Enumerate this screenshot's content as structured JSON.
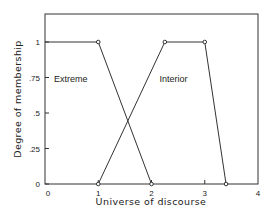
{
  "chart_data": {
    "type": "line",
    "title": "",
    "xlabel": "Universe of discourse",
    "ylabel": "Degree of membership",
    "xlim": [
      0,
      4
    ],
    "ylim": [
      0,
      1
    ],
    "grid": false,
    "legend": "inline labels",
    "x_ticks": [
      "0",
      "1",
      "2",
      "3",
      "4"
    ],
    "x_tick_values": [
      0,
      1,
      2,
      3,
      4
    ],
    "y_ticks": [
      "0",
      ".25",
      ".5",
      ".75",
      "1"
    ],
    "y_tick_values": [
      0,
      0.25,
      0.5,
      0.75,
      1
    ],
    "series": [
      {
        "name": "Extreme",
        "points": [
          [
            0,
            1
          ],
          [
            1,
            1
          ],
          [
            2,
            0
          ]
        ],
        "markers": [
          [
            1,
            1
          ],
          [
            2,
            0
          ]
        ],
        "label_pos": [
          0.17,
          0.72
        ]
      },
      {
        "name": "Interior",
        "points": [
          [
            1,
            0
          ],
          [
            2.25,
            1
          ],
          [
            3,
            1
          ],
          [
            3.4,
            0
          ]
        ],
        "markers": [
          [
            1,
            0
          ],
          [
            2.25,
            1
          ],
          [
            3,
            1
          ],
          [
            3.4,
            0
          ]
        ],
        "label_pos": [
          2.15,
          0.72
        ]
      }
    ]
  }
}
